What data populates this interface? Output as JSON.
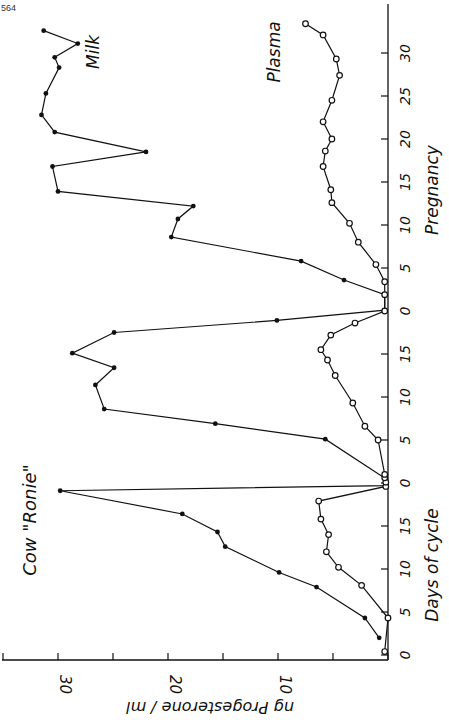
{
  "page_number": "564",
  "chart_data": {
    "type": "line",
    "title": "Cow \"Ronie\"",
    "orientation": "rotated 90° clockwise (value axis horizontal at bottom, days vertical on right)",
    "xlabel": "Days of cycle / Pregnancy",
    "ylabel": "ng Progesterone / ml",
    "ylim": [
      0,
      35
    ],
    "value_ticks": [
      0,
      5,
      10,
      15,
      20,
      25,
      30,
      35
    ],
    "value_tick_labels": [
      {
        "v": 10,
        "label": "10"
      },
      {
        "v": 20,
        "label": "20"
      },
      {
        "v": 30,
        "label": "30"
      }
    ],
    "x_segments": [
      {
        "name": "Days of cycle (1st)",
        "start_index": 0,
        "tick_labels": [
          "0",
          "5",
          "10",
          "15"
        ]
      },
      {
        "name": "Days of cycle (2nd)",
        "start_index": 20,
        "tick_labels": [
          "0",
          "5",
          "10",
          "15"
        ]
      },
      {
        "name": "Pregnancy",
        "start_index": 40,
        "tick_labels": [
          "0",
          "5",
          "10",
          "15",
          "20",
          "25",
          "30"
        ]
      }
    ],
    "axis_labels": {
      "days_of_cycle": "Days of cycle",
      "pregnancy": "Pregnancy",
      "value": "ng Progesterone / ml",
      "cow": "Cow  \"Ronie\""
    },
    "series": [
      {
        "name": "Milk",
        "marker": "filled",
        "points": [
          {
            "d": 2,
            "v": 0.8
          },
          {
            "d": 4.3,
            "v": 2.1
          },
          {
            "d": 7.9,
            "v": 6.5
          },
          {
            "d": 9.6,
            "v": 9.9
          },
          {
            "d": 12.6,
            "v": 14.8
          },
          {
            "d": 14.3,
            "v": 15.5
          },
          {
            "d": 16.4,
            "v": 18.7
          },
          {
            "d": 19.1,
            "v": 29.8
          },
          {
            "d": 19.7,
            "v": 0.2
          },
          {
            "d": 20.1,
            "v": 0.2
          },
          {
            "d": 20.5,
            "v": 0.2
          },
          {
            "d": 25.1,
            "v": 5.7
          },
          {
            "d": 26.9,
            "v": 15.7
          },
          {
            "d": 28.6,
            "v": 25.8
          },
          {
            "d": 31.4,
            "v": 26.6
          },
          {
            "d": 33.4,
            "v": 24.9
          },
          {
            "d": 35.1,
            "v": 28.7
          },
          {
            "d": 37.5,
            "v": 24.9
          },
          {
            "d": 38.9,
            "v": 10.1
          },
          {
            "d": 40.1,
            "v": 0.3
          },
          {
            "d": 41.9,
            "v": 0.3
          },
          {
            "d": 43.6,
            "v": 4.0
          },
          {
            "d": 45.8,
            "v": 7.9
          },
          {
            "d": 48.6,
            "v": 19.7
          },
          {
            "d": 50.7,
            "v": 19.1
          },
          {
            "d": 52.2,
            "v": 17.7
          },
          {
            "d": 53.9,
            "v": 30.0
          },
          {
            "d": 56.8,
            "v": 30.5
          },
          {
            "d": 58.5,
            "v": 22.0
          },
          {
            "d": 60.8,
            "v": 30.3
          },
          {
            "d": 62.8,
            "v": 31.5
          },
          {
            "d": 65.3,
            "v": 31.1
          },
          {
            "d": 68.3,
            "v": 29.9
          },
          {
            "d": 69.5,
            "v": 30.3
          },
          {
            "d": 71.1,
            "v": 28.2
          },
          {
            "d": 72.6,
            "v": 31.3
          }
        ]
      },
      {
        "name": "Plasma",
        "marker": "open",
        "points": [
          {
            "d": 0.4,
            "v": 0.3
          },
          {
            "d": 4.3,
            "v": 0.0
          },
          {
            "d": 8.1,
            "v": 2.4
          },
          {
            "d": 10.2,
            "v": 4.5
          },
          {
            "d": 12.0,
            "v": 5.6
          },
          {
            "d": 14.0,
            "v": 5.4
          },
          {
            "d": 15.8,
            "v": 6.1
          },
          {
            "d": 17.9,
            "v": 6.3
          },
          {
            "d": 19.6,
            "v": 0.2
          },
          {
            "d": 20.1,
            "v": 0.2
          },
          {
            "d": 20.6,
            "v": 0.3
          },
          {
            "d": 21.0,
            "v": 0.3
          },
          {
            "d": 25.0,
            "v": 0.9
          },
          {
            "d": 26.6,
            "v": 2.1
          },
          {
            "d": 29.3,
            "v": 3.2
          },
          {
            "d": 32.5,
            "v": 4.8
          },
          {
            "d": 34.3,
            "v": 5.5
          },
          {
            "d": 35.5,
            "v": 6.1
          },
          {
            "d": 37.2,
            "v": 5.2
          },
          {
            "d": 38.6,
            "v": 3.0
          },
          {
            "d": 40.0,
            "v": 0.3
          },
          {
            "d": 41.9,
            "v": 0.3
          },
          {
            "d": 43.4,
            "v": 0.3
          },
          {
            "d": 45.4,
            "v": 1.1
          },
          {
            "d": 48.0,
            "v": 2.7
          },
          {
            "d": 50.2,
            "v": 3.5
          },
          {
            "d": 52.6,
            "v": 5.1
          },
          {
            "d": 54.1,
            "v": 5.2
          },
          {
            "d": 56.8,
            "v": 5.9
          },
          {
            "d": 58.6,
            "v": 5.7
          },
          {
            "d": 60.0,
            "v": 5.1
          },
          {
            "d": 62.0,
            "v": 5.9
          },
          {
            "d": 64.5,
            "v": 5.1
          },
          {
            "d": 67.4,
            "v": 4.4
          },
          {
            "d": 69.3,
            "v": 4.7
          },
          {
            "d": 72.1,
            "v": 5.9
          },
          {
            "d": 73.4,
            "v": 7.5
          }
        ]
      }
    ],
    "annotations": [
      {
        "text": "Milk",
        "near": "milk series, pregnancy end"
      },
      {
        "text": "Plasma",
        "near": "plasma series, pregnancy end"
      },
      {
        "text": "Cow \"Ronie\"",
        "near": "upper left of rotated chart"
      }
    ],
    "grid": false,
    "legend": "inline labels"
  }
}
